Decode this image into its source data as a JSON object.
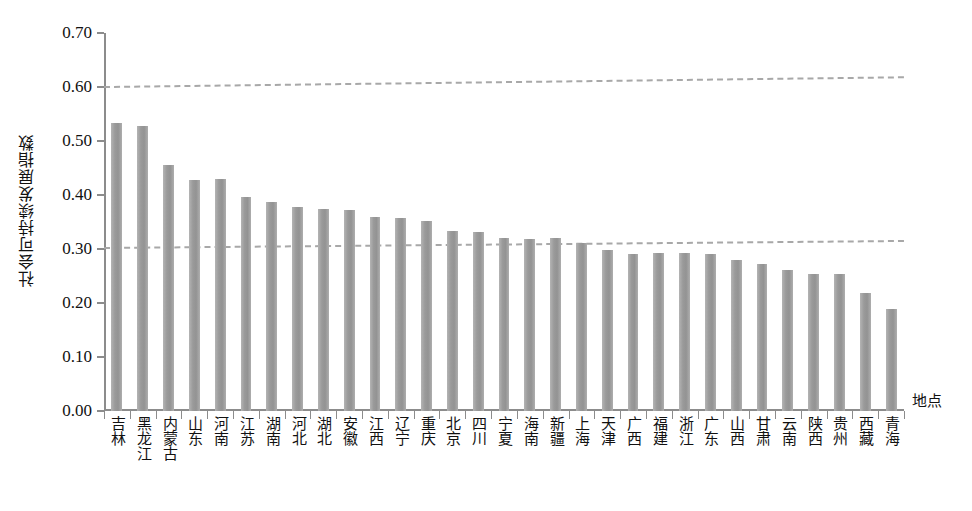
{
  "chart_data": {
    "type": "bar",
    "title": "",
    "xlabel": "地点",
    "ylabel": "社会可持续发展指数",
    "ylim": [
      0.0,
      0.7
    ],
    "ytick_labels": [
      "0.70",
      "0.60",
      "0.50",
      "0.40",
      "0.30",
      "0.20",
      "0.10",
      "0.00"
    ],
    "ytick_values": [
      0.7,
      0.6,
      0.5,
      0.4,
      0.3,
      0.2,
      0.1,
      0.0
    ],
    "grid": false,
    "legend": "none",
    "bar_color": "#9a9a9a",
    "reference_lines": [
      {
        "name": "upper-reference-line",
        "y_left": 0.601,
        "y_right": 0.619,
        "style": "dashed",
        "color": "#a8a8a8"
      },
      {
        "name": "lower-reference-line",
        "y_left": 0.303,
        "y_right": 0.316,
        "style": "dashed",
        "color": "#a8a8a8"
      }
    ],
    "categories": [
      "吉林",
      "黑龙江",
      "内蒙古",
      "山东",
      "河南",
      "江苏",
      "湖南",
      "河北",
      "湖北",
      "安徽",
      "江西",
      "辽宁",
      "重庆",
      "北京",
      "四川",
      "宁夏",
      "海南",
      "新疆",
      "上海",
      "天津",
      "广西",
      "福建",
      "浙江",
      "广东",
      "山西",
      "甘肃",
      "云南",
      "陕西",
      "贵州",
      "西藏",
      "青海"
    ],
    "values": [
      0.533,
      0.527,
      0.456,
      0.428,
      0.43,
      0.397,
      0.387,
      0.378,
      0.374,
      0.372,
      0.36,
      0.357,
      0.351,
      0.333,
      0.331,
      0.32,
      0.318,
      0.32,
      0.311,
      0.299,
      0.291,
      0.292,
      0.292,
      0.291,
      0.28,
      0.273,
      0.262,
      0.254,
      0.254,
      0.219,
      0.188
    ]
  }
}
